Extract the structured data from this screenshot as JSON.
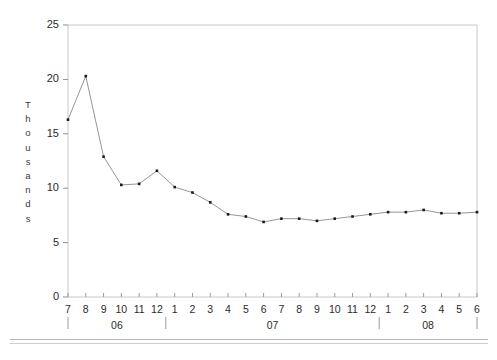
{
  "chart_data": {
    "type": "line",
    "title": "",
    "xlabel": "",
    "ylabel": "Thousands",
    "ylim": [
      0,
      25
    ],
    "yticks": [
      0,
      5,
      10,
      15,
      20,
      25
    ],
    "grid": false,
    "legend": null,
    "marker": "square",
    "line_color": "#8a8a8a",
    "marker_color": "#1a1a1a",
    "frame_color": "#c8c8c8",
    "x_tick_labels": [
      "7",
      "8",
      "9",
      "10",
      "11",
      "12",
      "1",
      "2",
      "3",
      "4",
      "5",
      "6",
      "7",
      "8",
      "9",
      "10",
      "11",
      "12",
      "1",
      "2",
      "3",
      "4",
      "5",
      "6"
    ],
    "x_group_labels": [
      "06",
      "07",
      "08"
    ],
    "categories": [
      "06-7",
      "06-8",
      "06-9",
      "06-10",
      "06-11",
      "06-12",
      "07-1",
      "07-2",
      "07-3",
      "07-4",
      "07-5",
      "07-6",
      "07-7",
      "07-8",
      "07-9",
      "07-10",
      "07-11",
      "07-12",
      "08-1",
      "08-2",
      "08-3",
      "08-4",
      "08-5",
      "08-6"
    ],
    "values": [
      16.3,
      20.3,
      12.9,
      10.3,
      10.4,
      11.6,
      10.1,
      9.6,
      8.7,
      7.6,
      7.4,
      6.9,
      7.2,
      7.2,
      7.0,
      7.2,
      7.4,
      7.6,
      7.8,
      7.8,
      8.0,
      7.7,
      7.7,
      7.8
    ]
  },
  "ylabel_letters": [
    "T",
    "h",
    "o",
    "u",
    "s",
    "a",
    "n",
    "d",
    "s"
  ]
}
